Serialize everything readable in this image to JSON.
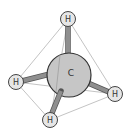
{
  "molecule": {
    "name": "methane",
    "colors": {
      "edge": "#b0b0b0",
      "bond": "#8a8a8a",
      "bond_highlight": "#bdbdbd",
      "carbon_fill": "#c6c6c6",
      "hydrogen_fill": "#e6e6e6",
      "outline": "#444444"
    },
    "carbon": {
      "label": "C",
      "x": 69,
      "y": 75,
      "r": 22
    },
    "hydrogens": [
      {
        "id": "top",
        "label": "H",
        "x": 68,
        "y": 19,
        "r": 7.5
      },
      {
        "id": "left",
        "label": "H",
        "x": 16,
        "y": 82,
        "r": 7.5
      },
      {
        "id": "right",
        "label": "H",
        "x": 115,
        "y": 94,
        "r": 7.5
      },
      {
        "id": "bottom",
        "label": "H",
        "x": 50,
        "y": 120,
        "r": 7.5
      }
    ]
  }
}
